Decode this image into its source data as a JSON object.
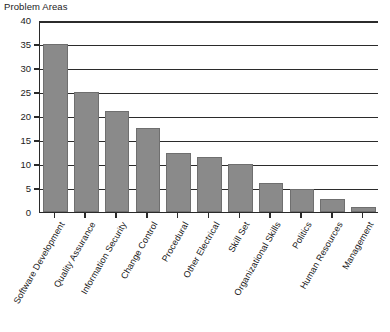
{
  "chart_data": {
    "type": "bar",
    "title": "Problem Areas",
    "xlabel": "",
    "ylabel": "",
    "ylim": [
      0,
      40
    ],
    "ytick_step": 5,
    "yticks": [
      0,
      5,
      10,
      15,
      20,
      25,
      30,
      35,
      40
    ],
    "grid": true,
    "legend": false,
    "orientation": "vertical",
    "bar_color": "#8a8a8a",
    "categories": [
      "Software Development",
      "Quality Assurance",
      "Information Security",
      "Change Control",
      "Procedural",
      "Other Electrical",
      "Skill Set",
      "Organizational Skills",
      "Politics",
      "Human Resources",
      "Management"
    ],
    "values": [
      35,
      25,
      21,
      17.5,
      12.3,
      11.5,
      10,
      6,
      4.7,
      2.8,
      1
    ]
  }
}
